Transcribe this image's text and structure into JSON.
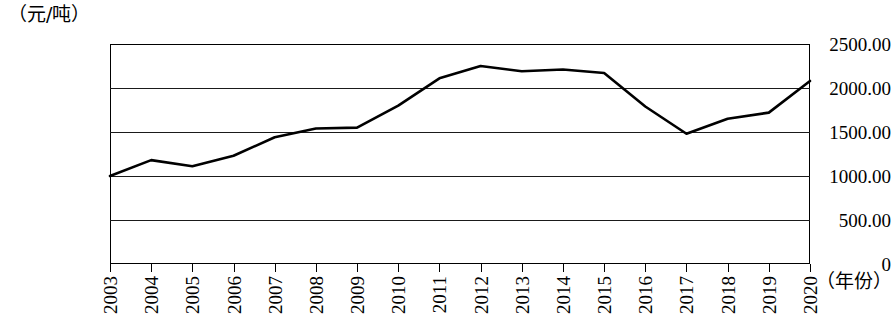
{
  "chart_data": {
    "type": "line",
    "title": "",
    "subtitle": "",
    "xlabel": "（年份）",
    "ylabel": "（元/吨）",
    "x": [
      2003,
      2004,
      2005,
      2006,
      2007,
      2008,
      2009,
      2010,
      2011,
      2012,
      2013,
      2014,
      2015,
      2016,
      2017,
      2018,
      2019,
      2020
    ],
    "categories": [
      "2003",
      "2004",
      "2005",
      "2006",
      "2007",
      "2008",
      "2009",
      "2010",
      "2011",
      "2012",
      "2013",
      "2014",
      "2015",
      "2016",
      "2017",
      "2018",
      "2019",
      "2020"
    ],
    "values": [
      1000,
      1180,
      1110,
      1230,
      1440,
      1540,
      1550,
      1800,
      2110,
      2250,
      2190,
      2210,
      2170,
      1790,
      1480,
      1650,
      1720,
      2080
    ],
    "series": [
      {
        "name": "价格",
        "values": [
          1000,
          1180,
          1110,
          1230,
          1440,
          1540,
          1550,
          1800,
          2110,
          2250,
          2190,
          2210,
          2170,
          1790,
          1480,
          1650,
          1720,
          2080
        ]
      }
    ],
    "ylim": [
      0,
      2500
    ],
    "y_ticks": [
      0,
      500,
      1000,
      1500,
      2000,
      2500
    ],
    "y_tick_labels": [
      "0",
      "500.00",
      "1000.00",
      "1500.00",
      "2000.00",
      "2500.00"
    ],
    "xlim": [
      2003,
      2020
    ],
    "grid": "horizontal",
    "legend": "none",
    "line_color": "#000000",
    "line_width": 2.6,
    "markers": "none",
    "x_label_rotation": -90
  }
}
